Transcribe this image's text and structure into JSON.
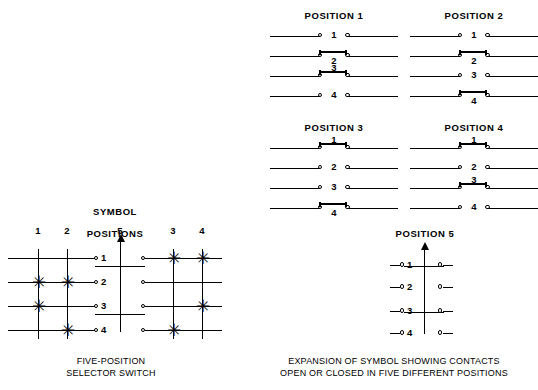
{
  "figure": {
    "symbol_heading": "SYMBOL",
    "positions_heading": "POSITIONS",
    "symbol_caption_line1": "FIVE-POSITION",
    "symbol_caption_line2": "SELECTOR SWITCH",
    "expansion_caption_line1": "EXPANSION OF SYMBOL SHOWING CONTACTS",
    "expansion_caption_line2": "OPEN OR CLOSED IN FIVE DIFFERENT POSITIONS",
    "line_color": "#000000",
    "background_color": "#ffffff"
  },
  "symbol": {
    "column_order": [
      "1",
      "2",
      "5",
      "3",
      "4"
    ],
    "contact_labels": [
      "1",
      "2",
      "3",
      "4"
    ],
    "closed_marker": "✳",
    "closed_matrix": {
      "1": [
        2,
        3
      ],
      "2": [
        2,
        4
      ],
      "3": [
        1,
        4
      ],
      "4": [
        1,
        3
      ],
      "5": []
    }
  },
  "expansion": {
    "panels": [
      {
        "title": "POSITION 1",
        "contacts": [
          {
            "label": "1",
            "state": "open",
            "label_pos": "mid"
          },
          {
            "label": "2",
            "state": "closed",
            "label_pos": "below"
          },
          {
            "label": "3",
            "state": "closed",
            "label_pos": "above"
          },
          {
            "label": "4",
            "state": "open",
            "label_pos": "mid"
          }
        ]
      },
      {
        "title": "POSITION 2",
        "contacts": [
          {
            "label": "1",
            "state": "open",
            "label_pos": "mid"
          },
          {
            "label": "2",
            "state": "closed",
            "label_pos": "below"
          },
          {
            "label": "3",
            "state": "open",
            "label_pos": "mid"
          },
          {
            "label": "4",
            "state": "closed",
            "label_pos": "below"
          }
        ]
      },
      {
        "title": "POSITION 3",
        "contacts": [
          {
            "label": "1",
            "state": "closed",
            "label_pos": "above"
          },
          {
            "label": "2",
            "state": "open",
            "label_pos": "mid"
          },
          {
            "label": "3",
            "state": "open",
            "label_pos": "mid"
          },
          {
            "label": "4",
            "state": "closed",
            "label_pos": "below"
          }
        ]
      },
      {
        "title": "POSITION 4",
        "contacts": [
          {
            "label": "1",
            "state": "closed",
            "label_pos": "above"
          },
          {
            "label": "2",
            "state": "open",
            "label_pos": "mid"
          },
          {
            "label": "3",
            "state": "closed",
            "label_pos": "above"
          },
          {
            "label": "4",
            "state": "open",
            "label_pos": "mid"
          }
        ]
      }
    ],
    "position5": {
      "title": "POSITION 5",
      "contacts": [
        {
          "label": "1",
          "state": "open"
        },
        {
          "label": "2",
          "state": "open"
        },
        {
          "label": "3",
          "state": "open"
        },
        {
          "label": "4",
          "state": "open"
        }
      ]
    }
  }
}
